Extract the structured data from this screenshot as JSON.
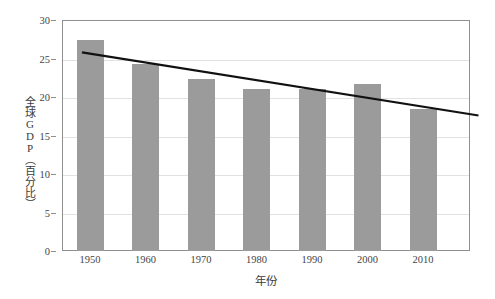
{
  "chart_data": {
    "type": "bar",
    "title": "",
    "xlabel": "年份",
    "ylabel": "全球GDP（百分比）",
    "categories": [
      "1950",
      "1960",
      "1970",
      "1980",
      "1990",
      "2000",
      "2010"
    ],
    "values": [
      27.4,
      24.3,
      22.4,
      21.1,
      21.0,
      21.7,
      18.4
    ],
    "ylim": [
      0,
      30
    ],
    "yticks": [
      0,
      5,
      10,
      15,
      20,
      25,
      30
    ],
    "ytick_labels": [
      "0",
      "5",
      "10",
      "15",
      "20",
      "25",
      "30"
    ],
    "grid": true,
    "legend": "none",
    "bar_color": "#9b9b9b",
    "series": [
      {
        "name": "全球GDP（百分比）",
        "type": "bar",
        "values": [
          27.4,
          24.3,
          22.4,
          21.1,
          21.0,
          21.7,
          18.4
        ]
      },
      {
        "name": "趋势线",
        "type": "line",
        "color": "#111111",
        "start": {
          "x": "1950",
          "y": 25.8
        },
        "end": {
          "x": "2020",
          "y": 17.6
        }
      }
    ],
    "annotations": []
  },
  "axes": {
    "y_title": "全球GDP（百分比）",
    "x_title": "年份"
  }
}
